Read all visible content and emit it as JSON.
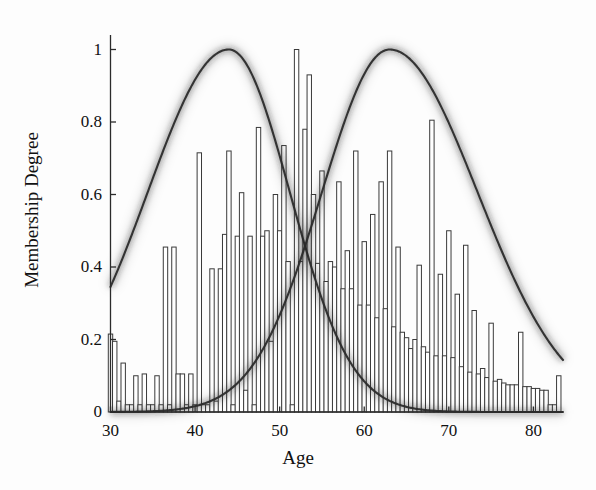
{
  "chart_data": {
    "type": "bar",
    "title": "",
    "subtitle": "",
    "xlabel": "Age",
    "ylabel": "Membership Degree",
    "xlim": [
      30,
      83.5
    ],
    "ylim": [
      0,
      1.04
    ],
    "grid": false,
    "legend": null,
    "xticks": [
      30,
      40,
      50,
      60,
      70,
      80
    ],
    "xticklabels": [
      "30",
      "40",
      "50",
      "60",
      "70",
      "80"
    ],
    "yticks": [
      0,
      0.2,
      0.4,
      0.6,
      0.8,
      1
    ],
    "yticklabels": [
      "0",
      "0.2",
      "0.4",
      "0.6",
      "0.8",
      "1"
    ],
    "bar_style": {
      "facecolor": "#ffffff",
      "edgecolor": "#3a3a3a",
      "linewidth": 1.0,
      "width_years": 0.52
    },
    "categories": [
      30,
      30.5,
      31,
      31.5,
      32,
      32.5,
      33,
      33.5,
      34,
      34.5,
      35,
      35.5,
      36,
      36.5,
      37,
      37.5,
      38,
      38.5,
      39,
      39.5,
      40,
      40.5,
      41,
      41.5,
      42,
      42.5,
      43,
      43.5,
      44,
      44.5,
      45,
      45.5,
      46,
      46.5,
      47,
      47.5,
      48,
      48.5,
      49,
      49.5,
      50,
      50.5,
      51,
      51.5,
      52,
      52.5,
      53,
      53.5,
      54,
      54.5,
      55,
      55.5,
      56,
      56.5,
      57,
      57.5,
      58,
      58.5,
      59,
      59.5,
      60,
      60.5,
      61,
      61.5,
      62,
      62.5,
      63,
      63.5,
      64,
      64.5,
      65,
      65.5,
      66,
      66.5,
      67,
      67.5,
      68,
      68.5,
      69,
      69.5,
      70,
      70.5,
      71,
      71.5,
      72,
      72.5,
      73,
      73.5,
      74,
      74.5,
      75,
      75.5,
      76,
      76.5,
      77,
      77.5,
      78,
      78.5,
      79,
      79.5,
      80,
      80.5,
      81,
      81.5,
      82,
      82.5,
      83
    ],
    "values": [
      0.215,
      0.195,
      0.03,
      0.135,
      0.02,
      0.02,
      0.1,
      0.02,
      0.105,
      0.02,
      0.02,
      0.1,
      0.02,
      0.455,
      0.02,
      0.455,
      0.105,
      0.105,
      0.02,
      0.105,
      0.02,
      0.715,
      0.02,
      0.02,
      0.395,
      0.03,
      0.395,
      0.49,
      0.72,
      0.02,
      0.485,
      0.605,
      0.06,
      0.485,
      0.02,
      0.785,
      0.485,
      0.5,
      0.195,
      0.6,
      0.5,
      0.735,
      0.415,
      0.02,
      1.0,
      0.415,
      0.78,
      0.93,
      0.6,
      0.41,
      0.665,
      0.36,
      0.415,
      0.4,
      0.635,
      0.34,
      0.445,
      0.34,
      0.72,
      0.295,
      0.47,
      0.295,
      0.545,
      0.26,
      0.635,
      0.285,
      0.72,
      0.235,
      0.455,
      0.22,
      0.205,
      0.175,
      0.2,
      0.405,
      0.18,
      0.165,
      0.805,
      0.155,
      0.38,
      0.155,
      0.5,
      0.15,
      0.325,
      0.125,
      0.46,
      0.11,
      0.28,
      0.105,
      0.12,
      0.095,
      0.245,
      0.085,
      0.09,
      0.08,
      0.075,
      0.075,
      0.075,
      0.22,
      0.07,
      0.07,
      0.065,
      0.065,
      0.06,
      0.06,
      0.02,
      0.02,
      0.1
    ],
    "curves": [
      {
        "name": "young-membership",
        "style": "fuzzy-band",
        "color": "#2b2b2b",
        "peak_x": 44,
        "peak_y": 1.0,
        "start_x": 30,
        "start_y": 0.22,
        "end_x": 83.5,
        "end_y": 0.005,
        "sigma_left": 9.6,
        "sigma_right": 7.2
      },
      {
        "name": "old-membership",
        "style": "fuzzy-band",
        "color": "#2b2b2b",
        "peak_x": 63,
        "peak_y": 1.0,
        "start_x": 30,
        "start_y": 0.008,
        "end_x": 83.5,
        "end_y": 0.135,
        "sigma_left": 8.0,
        "sigma_right": 10.4
      }
    ],
    "crossing_point": {
      "x": 53.5,
      "y": 0.56
    },
    "annotations": []
  },
  "axes": {
    "spine_color": "#2b2b2b",
    "tick_color": "#2b2b2b"
  }
}
